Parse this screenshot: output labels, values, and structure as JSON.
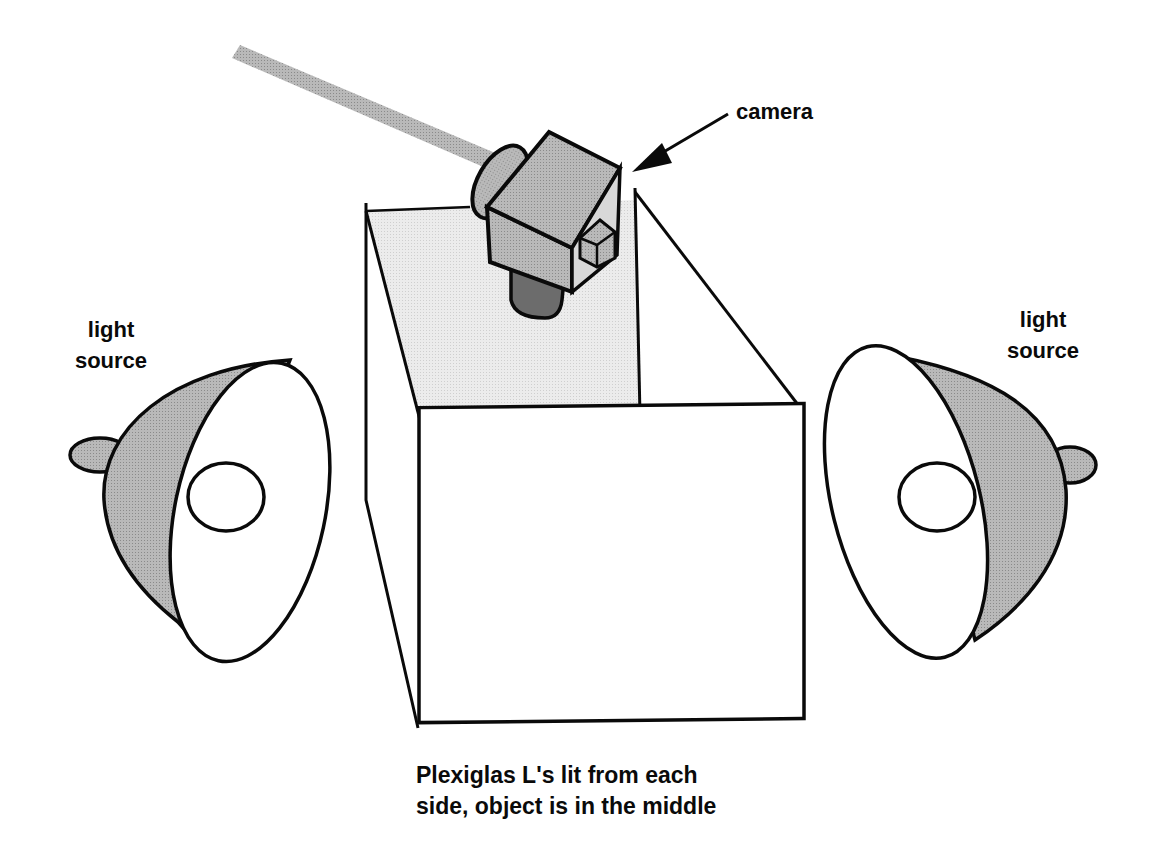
{
  "diagram": {
    "labels": {
      "camera": "camera",
      "light_left": {
        "line1": "light",
        "line2": "source"
      },
      "light_right": {
        "line1": "light",
        "line2": "source"
      }
    },
    "caption": {
      "line1": "Plexiglas L's lit from each",
      "line2": "side, object is in the middle"
    },
    "components": [
      "camera-on-boom-arm",
      "plexiglas-box",
      "left-light-source",
      "right-light-source",
      "pointer-arrow"
    ],
    "colors": {
      "stroke": "#0a0a0a",
      "camera_fill": "#9a9a9a",
      "camera_dark": "#6e6e6e",
      "boom_fill": "#7f7f7f",
      "back_panel_fill": "#e9e9e9",
      "lamp_shade_fill": "#b4b4b4",
      "background": "#ffffff"
    }
  }
}
